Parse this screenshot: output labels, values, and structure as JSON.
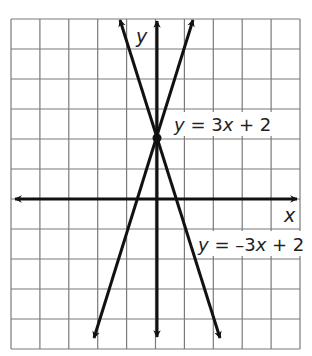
{
  "chart_data": {
    "type": "line",
    "title": "",
    "xlabel": "x",
    "ylabel": "y",
    "xlim": [
      -5,
      5
    ],
    "ylim": [
      -5,
      6
    ],
    "grid": true,
    "tick_labels_shown": false,
    "series": [
      {
        "name": "y = 3x + 2",
        "slope": 3,
        "intercept": 2,
        "label": "y = 3x + 2"
      },
      {
        "name": "y = -3x + 2",
        "slope": -3,
        "intercept": 2,
        "label": "y = –3x + 2"
      }
    ],
    "intersection": {
      "x": 0,
      "y": 2
    }
  },
  "labels": {
    "x_axis": "x",
    "y_axis": "y",
    "line1": "y = 3x + 2",
    "line2": "y = –3x + 2"
  },
  "colors": {
    "grid": "#7a7a7a",
    "axis": "#111111",
    "line": "#111111",
    "background": "#ffffff"
  }
}
